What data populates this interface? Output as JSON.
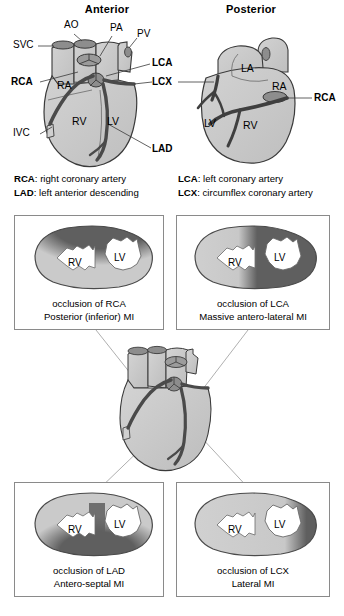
{
  "views": {
    "anterior": {
      "title": "Anterior",
      "labels": [
        {
          "id": "svc",
          "text": "SVC",
          "bold": false
        },
        {
          "id": "ao",
          "text": "AO",
          "bold": false
        },
        {
          "id": "pa",
          "text": "PA",
          "bold": false
        },
        {
          "id": "pv",
          "text": "PV",
          "bold": false
        },
        {
          "id": "rca",
          "text": "RCA",
          "bold": true
        },
        {
          "id": "lca",
          "text": "LCA",
          "bold": true
        },
        {
          "id": "lcx",
          "text": "LCX",
          "bold": true
        },
        {
          "id": "lad",
          "text": "LAD",
          "bold": true
        },
        {
          "id": "ivc",
          "text": "IVC",
          "bold": false
        }
      ],
      "chambers": [
        {
          "id": "ra",
          "text": "RA"
        },
        {
          "id": "rv",
          "text": "RV"
        },
        {
          "id": "lv",
          "text": "LV"
        }
      ]
    },
    "posterior": {
      "title": "Posterior",
      "labels": [
        {
          "id": "rca",
          "text": "RCA",
          "bold": true
        }
      ],
      "chambers": [
        {
          "id": "la",
          "text": "LA"
        },
        {
          "id": "ra",
          "text": "RA"
        },
        {
          "id": "lv",
          "text": "LV"
        },
        {
          "id": "rv",
          "text": "RV"
        }
      ]
    }
  },
  "legend": {
    "entries": [
      {
        "abbr": "RCA",
        "sep": ": ",
        "text": "right coronary artery"
      },
      {
        "abbr": "LAD",
        "sep": ": ",
        "text": "left anterior descending"
      },
      {
        "abbr": "LCA",
        "sep": ": ",
        "text": "left coronary artery"
      },
      {
        "abbr": "LCX",
        "sep": ": ",
        "text": "circumflex coronary artery"
      }
    ]
  },
  "cross_sections": [
    {
      "id": "rca",
      "position": "top-left",
      "caption_line1": "occlusion of RCA",
      "caption_line2": "Posterior (inferior) MI",
      "ventricles": [
        {
          "id": "rv",
          "text": "RV"
        },
        {
          "id": "lv",
          "text": "LV"
        }
      ],
      "infarct_region": "superior / posterior wall"
    },
    {
      "id": "lca",
      "position": "top-right",
      "caption_line1": "occlusion of LCA",
      "caption_line2": "Massive antero-lateral MI",
      "ventricles": [
        {
          "id": "rv",
          "text": "RV"
        },
        {
          "id": "lv",
          "text": "LV"
        }
      ],
      "infarct_region": "entire lateral and anterior wall"
    },
    {
      "id": "lad",
      "position": "bottom-left",
      "caption_line1": "occlusion of LAD",
      "caption_line2": "Antero-septal MI",
      "ventricles": [
        {
          "id": "rv",
          "text": "RV"
        },
        {
          "id": "lv",
          "text": "LV"
        }
      ],
      "infarct_region": "septum and inferior-anterior wall"
    },
    {
      "id": "lcx",
      "position": "bottom-right",
      "caption_line1": "occlusion of LCX",
      "caption_line2": "Lateral  MI",
      "ventricles": [
        {
          "id": "rv",
          "text": "RV"
        },
        {
          "id": "lv",
          "text": "LV"
        }
      ],
      "infarct_region": "lateral wall band"
    }
  ],
  "colors": {
    "myocardium": "#c8c8c8",
    "myocardium_light": "#d6d6d6",
    "infarct": "#5f5f5f",
    "vessel": "#4a4a4a",
    "outline": "#333333",
    "panel_border": "#8a8a8a",
    "connector": "#9a9a9a",
    "cavity": "#ffffff",
    "background": "#ffffff"
  }
}
